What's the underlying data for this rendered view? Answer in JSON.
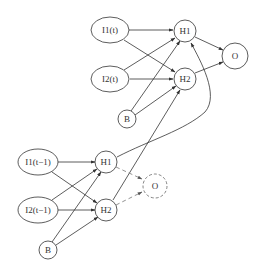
{
  "diagram": {
    "top_layer": {
      "inputs": [
        {
          "id": "I1_t",
          "label": "I1(t)"
        },
        {
          "id": "I2_t",
          "label": "I2(t)"
        }
      ],
      "bias": {
        "id": "B_t",
        "label": "B"
      },
      "hidden": [
        {
          "id": "H1_t",
          "label": "H1"
        },
        {
          "id": "H2_t",
          "label": "H2"
        }
      ],
      "output": {
        "id": "O_t",
        "label": "O",
        "style": "solid"
      }
    },
    "bottom_layer": {
      "inputs": [
        {
          "id": "I1_t1",
          "label": "I1(t−1)"
        },
        {
          "id": "I2_t1",
          "label": "I2(t−1)"
        }
      ],
      "bias": {
        "id": "B_t1",
        "label": "B"
      },
      "hidden": [
        {
          "id": "H1_t1",
          "label": "H1"
        },
        {
          "id": "H2_t1",
          "label": "H2"
        }
      ],
      "output": {
        "id": "O_t1",
        "label": "O",
        "style": "dashed"
      }
    },
    "edges": [
      {
        "from": "I1_t",
        "to": "H1_t"
      },
      {
        "from": "I1_t",
        "to": "H2_t"
      },
      {
        "from": "I2_t",
        "to": "H1_t"
      },
      {
        "from": "I2_t",
        "to": "H2_t"
      },
      {
        "from": "B_t",
        "to": "H1_t"
      },
      {
        "from": "B_t",
        "to": "H2_t"
      },
      {
        "from": "H1_t",
        "to": "O_t"
      },
      {
        "from": "H2_t",
        "to": "O_t"
      },
      {
        "from": "I1_t1",
        "to": "H1_t1"
      },
      {
        "from": "I1_t1",
        "to": "H2_t1"
      },
      {
        "from": "I2_t1",
        "to": "H1_t1"
      },
      {
        "from": "I2_t1",
        "to": "H2_t1"
      },
      {
        "from": "B_t1",
        "to": "H1_t1"
      },
      {
        "from": "B_t1",
        "to": "H2_t1"
      },
      {
        "from": "H1_t1",
        "to": "O_t1",
        "style": "dashed"
      },
      {
        "from": "H2_t1",
        "to": "O_t1",
        "style": "dashed"
      },
      {
        "from": "H1_t1",
        "to": "H1_t",
        "style": "curved"
      },
      {
        "from": "H2_t1",
        "to": "H2_t"
      }
    ]
  }
}
